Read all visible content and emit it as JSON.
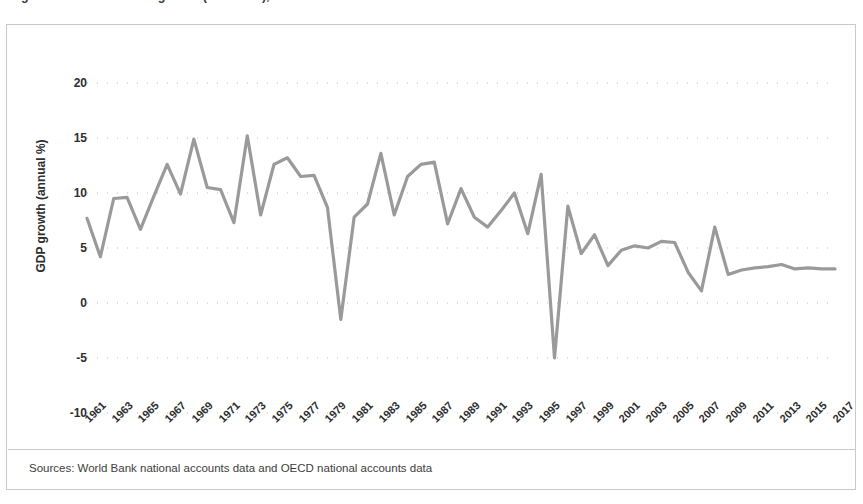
{
  "figure": {
    "title": "Figure 1. Indonesia GDP growth (annual %), 1961-2017",
    "source_note": "Sources: World Bank national accounts data and OECD national accounts data"
  },
  "axes": {
    "y_title": "GDP growth (annual %)",
    "y_ticks": [
      "20",
      "15",
      "10",
      "5",
      "0",
      "-5",
      "-10"
    ],
    "x_ticks": [
      "1961",
      "1963",
      "1965",
      "1967",
      "1969",
      "1971",
      "1973",
      "1975",
      "1977",
      "1979",
      "1981",
      "1983",
      "1985",
      "1987",
      "1989",
      "1991",
      "1993",
      "1995",
      "1997",
      "1999",
      "2001",
      "2003",
      "2005",
      "2007",
      "2009",
      "2011",
      "2013",
      "2015",
      "2017"
    ]
  },
  "style": {
    "line_color": "#9a9a9a",
    "grid_dot_color": "#b9b9b9",
    "frame_color": "#c9c9c9",
    "text_color": "#2e2e2e"
  },
  "chart_data": {
    "type": "line",
    "title": "Figure 1. Indonesia GDP growth (annual %), 1961-2017",
    "xlabel": "",
    "ylabel": "GDP growth (annual %)",
    "ylim": [
      -10,
      20
    ],
    "xlim": [
      1961,
      2017
    ],
    "yticks": [
      -10,
      -5,
      0,
      5,
      10,
      15,
      20
    ],
    "grid": "dotted-horizontal",
    "legend": "none",
    "x": [
      1961,
      1962,
      1963,
      1964,
      1965,
      1966,
      1967,
      1968,
      1969,
      1970,
      1971,
      1972,
      1973,
      1974,
      1975,
      1976,
      1977,
      1978,
      1979,
      1980,
      1981,
      1982,
      1983,
      1984,
      1985,
      1986,
      1987,
      1988,
      1989,
      1990,
      1991,
      1992,
      1993,
      1994,
      1995,
      1996,
      1997,
      1998,
      1999,
      2000,
      2001,
      2002,
      2003,
      2004,
      2005,
      2006,
      2007,
      2008,
      2009,
      2010,
      2011,
      2012,
      2013,
      2014,
      2015,
      2016,
      2017
    ],
    "series": [
      {
        "name": "GDP growth (annual %)",
        "values": [
          7.7,
          4.2,
          9.5,
          9.6,
          6.7,
          9.7,
          12.6,
          9.9,
          14.9,
          10.5,
          10.3,
          7.3,
          15.2,
          8.0,
          12.6,
          13.2,
          11.5,
          11.6,
          8.7,
          -1.5,
          7.8,
          9.0,
          13.6,
          8.0,
          11.5,
          12.6,
          12.8,
          7.2,
          10.4,
          7.8,
          6.9,
          8.4,
          10.0,
          6.3,
          11.7,
          -5.0,
          8.8,
          4.5,
          6.2,
          3.4,
          4.8,
          5.2,
          5.0,
          5.6,
          5.5,
          2.8,
          1.1,
          6.9,
          2.6,
          3.0,
          3.2,
          3.3,
          3.5,
          3.1,
          3.2,
          3.1,
          3.1
        ]
      }
    ]
  }
}
